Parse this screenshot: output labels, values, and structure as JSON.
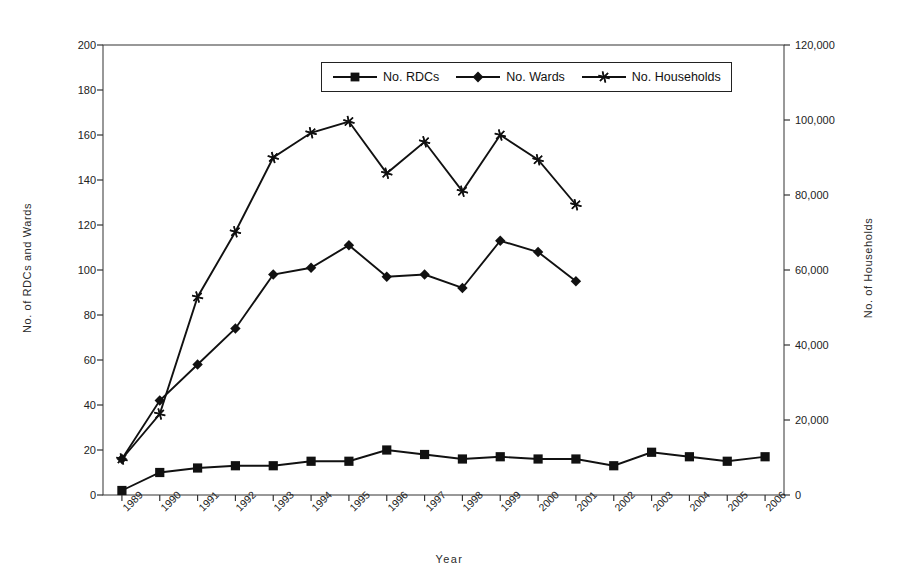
{
  "chart_data": {
    "type": "line",
    "title": "",
    "subtitle": "",
    "xlabel": "Year",
    "ylabel": "No. of RDCs and Wards",
    "y2label": "No. of Households",
    "grid": false,
    "legend_position": "top-center",
    "categories": [
      "1989",
      "1990",
      "1991",
      "1992",
      "1993",
      "1994",
      "1995",
      "1996",
      "1997",
      "1998",
      "1999",
      "2000",
      "2001",
      "2002",
      "2003",
      "2004",
      "2005",
      "2006"
    ],
    "ylim": [
      0,
      200
    ],
    "yticks": [
      "0",
      "20",
      "40",
      "60",
      "80",
      "100",
      "120",
      "140",
      "160",
      "180",
      "200"
    ],
    "ytick_values": [
      0,
      20,
      40,
      60,
      80,
      100,
      120,
      140,
      160,
      180,
      200
    ],
    "y2lim": [
      0,
      120000
    ],
    "y2ticks": [
      "0",
      "20,000",
      "40,000",
      "60,000",
      "80,000",
      "100,000",
      "120,000"
    ],
    "y2tick_values": [
      0,
      20000,
      40000,
      60000,
      80000,
      100000,
      120000
    ],
    "series": [
      {
        "name": "No. RDCs",
        "axis": "left",
        "marker": "square",
        "values": [
          2,
          10,
          12,
          13,
          13,
          15,
          15,
          20,
          18,
          16,
          17,
          16,
          16,
          13,
          19,
          17,
          15,
          17
        ]
      },
      {
        "name": "No. Wards",
        "axis": "left",
        "marker": "diamond",
        "values": [
          16,
          42,
          58,
          74,
          98,
          101,
          111,
          97,
          98,
          92,
          113,
          108,
          95,
          null,
          null,
          null,
          null,
          null
        ]
      },
      {
        "name": "No. Households",
        "axis": "right",
        "marker": "asterisk",
        "values": [
          9600,
          21600,
          52800,
          70200,
          90000,
          96600,
          99600,
          85800,
          94200,
          81000,
          96000,
          89400,
          77400,
          null,
          null,
          null,
          null,
          null
        ]
      }
    ]
  },
  "legend": {
    "items": [
      {
        "label": "No. RDCs",
        "marker": "square-marker-icon"
      },
      {
        "label": "No. Wards",
        "marker": "diamond-marker-icon"
      },
      {
        "label": "No. Households",
        "marker": "asterisk-marker-icon"
      }
    ]
  },
  "colors": {
    "line": "#111111",
    "axis": "#333333",
    "background": "#ffffff"
  }
}
